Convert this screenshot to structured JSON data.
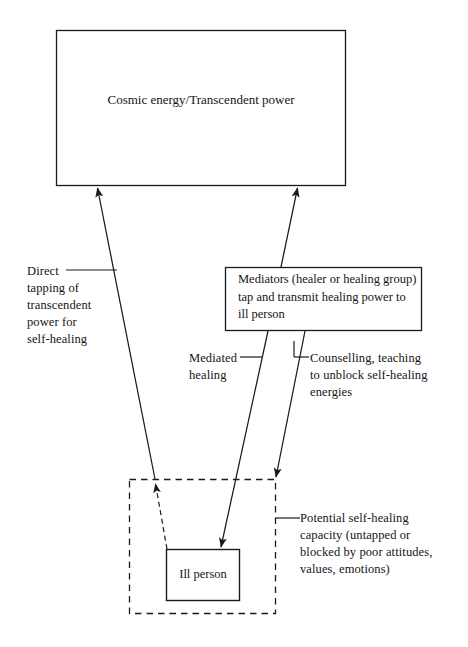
{
  "diagram": {
    "boxes": {
      "cosmic": {
        "label": "Cosmic energy/Transcendent power",
        "shape": "rectangle",
        "border": "solid"
      },
      "mediators": {
        "label": "Mediators (healer or healing group) tap and transmit healing power to ill person",
        "line1": "Mediators (healer or healing",
        "line2": "group) tap and transmit",
        "line3": "healing power to ill person",
        "shape": "rectangle",
        "border": "solid"
      },
      "ill_person": {
        "label": "Ill person",
        "shape": "rectangle",
        "border": "solid"
      },
      "potential_capacity_region": {
        "label": "",
        "shape": "rectangle",
        "border": "dashed"
      }
    },
    "annotations": {
      "direct": {
        "text": "Direct\ntapping of\ntranscendent\npower for\nself-healing",
        "leader": "solid"
      },
      "mediated": {
        "text": "Mediated\nhealing",
        "leader": "solid"
      },
      "counselling": {
        "text": "Counselling, teaching\nto unblock self-healing\nenergies",
        "leader": "solid"
      },
      "potential": {
        "text": "Potential self-healing\ncapacity (untapped or\nblocked by poor attitudes,\nvalues, emotions)",
        "leader": "solid"
      }
    },
    "arrows": [
      {
        "name": "direct-self-healing-arrow",
        "from": "potential-self-healing-capacity",
        "to": "cosmic-energy-box",
        "style": "solid",
        "head": "up"
      },
      {
        "name": "mediators-to-cosmic-arrow",
        "from": "mediators-box",
        "to": "cosmic-energy-box",
        "style": "solid",
        "head": "up"
      },
      {
        "name": "mediated-healing-arrow",
        "from": "mediators-box",
        "to": "ill-person-box",
        "style": "solid",
        "head": "down"
      },
      {
        "name": "counselling-arrow",
        "from": "mediators-box",
        "to": "potential-self-healing-capacity",
        "style": "solid",
        "head": "down"
      },
      {
        "name": "ill-person-to-capacity-arrow",
        "from": "ill-person-box",
        "to": "potential-self-healing-capacity",
        "style": "dashed",
        "head": "up"
      }
    ],
    "colors": {
      "stroke": "#1a1a1a",
      "background": "#ffffff",
      "text": "#141414"
    }
  }
}
